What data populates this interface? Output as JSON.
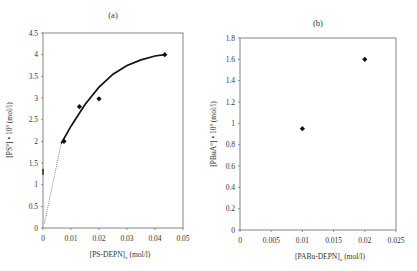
{
  "chart_data": [
    {
      "type": "scatter",
      "panel_label": "(a)",
      "title": "(a)",
      "xlabel": "[PS-DEPN]o (mol/l)",
      "xlabel_main": "[PS-DEPN]",
      "xlabel_sub": "o",
      "xlabel_unit": " (mol/l)",
      "ylabel": "[PS°] • 10^8 (mol/l)",
      "ylabel_main": "[PS°] • 10",
      "ylabel_sup": "8",
      "ylabel_unit": " (mol/l)",
      "xlim": [
        0,
        0.05
      ],
      "ylim": [
        0,
        4.5
      ],
      "xticks": [
        "0",
        "0.01",
        "0.02",
        "0.03",
        "0.04",
        "0.05"
      ],
      "yticks": [
        "0",
        "0.5",
        "1",
        "1.5",
        "2",
        "2.5",
        "3",
        "3.5",
        "4",
        "4.5"
      ],
      "grid": false,
      "legend": null,
      "series": [
        {
          "name": "data",
          "marker": "diamond",
          "points": [
            {
              "x": 0.0075,
              "y": 2.0
            },
            {
              "x": 0.013,
              "y": 2.8
            },
            {
              "x": 0.02,
              "y": 2.98
            },
            {
              "x": 0.0435,
              "y": 4.0
            }
          ]
        },
        {
          "name": "fit-curve",
          "line": "solid",
          "points": [
            {
              "x": 0.0065,
              "y": 1.95
            },
            {
              "x": 0.01,
              "y": 2.35
            },
            {
              "x": 0.015,
              "y": 2.85
            },
            {
              "x": 0.02,
              "y": 3.25
            },
            {
              "x": 0.025,
              "y": 3.55
            },
            {
              "x": 0.03,
              "y": 3.75
            },
            {
              "x": 0.035,
              "y": 3.88
            },
            {
              "x": 0.04,
              "y": 3.97
            },
            {
              "x": 0.0435,
              "y": 4.0
            }
          ]
        },
        {
          "name": "extrapolation",
          "line": "dotted",
          "points": [
            {
              "x": 0.0005,
              "y": 0.1
            },
            {
              "x": 0.0065,
              "y": 1.95
            }
          ]
        }
      ],
      "annotations": [
        {
          "type": "axis-tick-mark",
          "x": 0,
          "y": 1.3
        }
      ]
    },
    {
      "type": "scatter",
      "panel_label": "(b)",
      "title": "(b)",
      "xlabel": "[PABu-DEPN]o (mol/l)",
      "xlabel_main": "[PABu-DEPN]",
      "xlabel_sub": "o",
      "xlabel_unit": " (mol/l)",
      "ylabel": "[PBuA°] • 10^8 (mol/l)",
      "ylabel_main": "[PBuA°] • 10",
      "ylabel_sup": "8",
      "ylabel_unit": " (mol/l)",
      "xlim": [
        0,
        0.025
      ],
      "ylim": [
        0,
        1.8
      ],
      "xticks": [
        "0",
        "0.005",
        "0.01",
        "0.015",
        "0.02",
        "0.025"
      ],
      "yticks": [
        "0",
        "0.2",
        "0.4",
        "0.6",
        "0.8",
        "1",
        "1.2",
        "1.4",
        "1.6",
        "1.8"
      ],
      "grid": false,
      "legend": null,
      "series": [
        {
          "name": "data",
          "marker": "diamond",
          "points": [
            {
              "x": 0.01,
              "y": 0.95
            },
            {
              "x": 0.02,
              "y": 1.6
            }
          ]
        }
      ]
    }
  ]
}
